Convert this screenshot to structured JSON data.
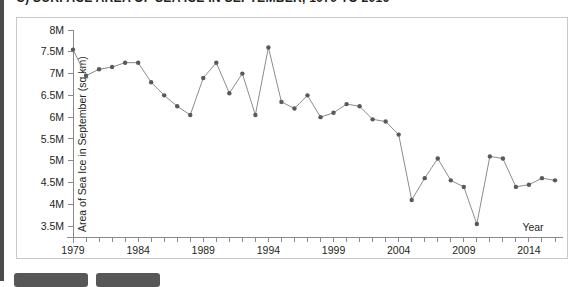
{
  "headline": "C) SURFACE AREA OF SEA ICE IN SEPTEMBER, 1979 TO 2016",
  "colors": {
    "line": "#8c8c8c",
    "marker": "#595959",
    "axis": "#8a8a8a",
    "text": "#231f20",
    "rule": "#4a4a4a",
    "button": "#575757"
  },
  "buttons": [
    {
      "name": "toolbar-button-1",
      "label": ""
    },
    {
      "name": "toolbar-button-2",
      "label": ""
    }
  ],
  "chart_data": {
    "type": "line",
    "title": "C) SURFACE AREA OF SEA ICE IN SEPTEMBER, 1979 TO 2016",
    "xlabel": "Year",
    "ylabel": "Area of Sea Ice in September (sq km)",
    "grid": false,
    "legend": null,
    "xlim": [
      1979,
      2016
    ],
    "ylim": [
      3.25,
      8.0
    ],
    "ytick_labels": [
      "8M",
      "7.5M",
      "7M",
      "6.5M",
      "6M",
      "5.5M",
      "5M",
      "4.5M",
      "4M",
      "3.5M"
    ],
    "ytick_values": [
      8.0,
      7.5,
      7.0,
      6.5,
      6.0,
      5.5,
      5.0,
      4.5,
      4.0,
      3.5
    ],
    "ytick_units": "millions of square kilometres",
    "xtick_labels": [
      "1979",
      "1984",
      "1989",
      "1994",
      "1999",
      "2004",
      "2009",
      "2014"
    ],
    "xtick_values": [
      1979,
      1984,
      1989,
      1994,
      1999,
      2004,
      2009,
      2014
    ],
    "xtick_minor_every": 1,
    "x": [
      1979,
      1980,
      1981,
      1982,
      1983,
      1984,
      1985,
      1986,
      1987,
      1988,
      1989,
      1990,
      1991,
      1992,
      1993,
      1994,
      1995,
      1996,
      1997,
      1998,
      1999,
      2000,
      2001,
      2002,
      2003,
      2004,
      2005,
      2006,
      2007,
      2008,
      2009,
      2010,
      2011,
      2012,
      2013,
      2014,
      2015,
      2016
    ],
    "values": [
      7.55,
      6.95,
      7.1,
      7.15,
      7.25,
      7.25,
      6.8,
      6.5,
      6.25,
      6.05,
      6.9,
      7.25,
      6.55,
      7.0,
      6.05,
      7.6,
      6.35,
      6.2,
      6.5,
      6.0,
      6.1,
      6.3,
      6.25,
      5.95,
      5.9,
      5.6,
      4.1,
      4.6,
      5.05,
      4.55,
      4.4,
      3.55,
      5.1,
      5.05,
      4.4,
      4.45,
      4.6,
      4.55
    ],
    "units_note": "values in millions of sq km"
  },
  "axis": {
    "y_title": "Area of Sea Ice in September (sq km)",
    "x_title": "Year"
  }
}
